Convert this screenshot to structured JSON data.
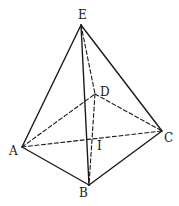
{
  "diagram": {
    "type": "pyramid",
    "colors": {
      "stroke": "#1a1a1a",
      "background": "#ffffff"
    },
    "points": [
      {
        "id": "E",
        "label": "E",
        "x": 81,
        "y": 25,
        "lx": 78,
        "ly": 19
      },
      {
        "id": "D",
        "label": "D",
        "x": 95,
        "y": 94,
        "lx": 100,
        "ly": 96
      },
      {
        "id": "A",
        "label": "A",
        "x": 22,
        "y": 147,
        "lx": 9,
        "ly": 155
      },
      {
        "id": "C",
        "label": "C",
        "x": 162,
        "y": 131,
        "lx": 164,
        "ly": 142
      },
      {
        "id": "B",
        "label": "B",
        "x": 89,
        "y": 185,
        "lx": 79,
        "ly": 197
      },
      {
        "id": "I",
        "label": "I",
        "x": 93,
        "y": 139,
        "lx": 97,
        "ly": 150
      }
    ],
    "edges": [
      {
        "from": "E",
        "to": "A",
        "style": "solid"
      },
      {
        "from": "E",
        "to": "B",
        "style": "solid"
      },
      {
        "from": "E",
        "to": "C",
        "style": "solid"
      },
      {
        "from": "A",
        "to": "B",
        "style": "solid"
      },
      {
        "from": "B",
        "to": "C",
        "style": "solid"
      },
      {
        "from": "E",
        "to": "D",
        "style": "dashed"
      },
      {
        "from": "A",
        "to": "D",
        "style": "dashed"
      },
      {
        "from": "D",
        "to": "C",
        "style": "dashed"
      },
      {
        "from": "A",
        "to": "C",
        "style": "dashed"
      },
      {
        "from": "D",
        "to": "B",
        "style": "dashed"
      }
    ]
  }
}
